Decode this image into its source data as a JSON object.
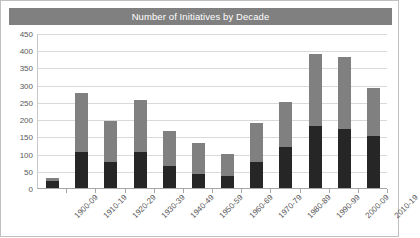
{
  "chart_data": {
    "type": "bar",
    "title": "Number of Initiatives by Decade",
    "xlabel": "",
    "ylabel": "",
    "ylim": [
      0,
      450
    ],
    "yticks": [
      0,
      50,
      100,
      150,
      200,
      250,
      300,
      350,
      400,
      450
    ],
    "ytick_labels": [
      "0",
      "50",
      "100",
      "150",
      "200",
      "250",
      "300",
      "350",
      "400",
      "450"
    ],
    "grid": true,
    "stacked": true,
    "legend": "none",
    "categories": [
      "1900-09",
      "1910-19",
      "1920-29",
      "1930-39",
      "1940-49",
      "1950-59",
      "1960-69",
      "1970-79",
      "1980-89",
      "1990-99",
      "2000-09",
      "2010-19"
    ],
    "series": [
      {
        "name": "lower-segment",
        "color": "#262626",
        "values": [
          20,
          105,
          75,
          105,
          65,
          40,
          35,
          75,
          120,
          180,
          170,
          150
        ]
      },
      {
        "name": "upper-segment",
        "color": "#808080",
        "values": [
          10,
          170,
          120,
          150,
          100,
          90,
          65,
          115,
          130,
          210,
          210,
          140
        ]
      }
    ],
    "totals": [
      30,
      275,
      195,
      255,
      165,
      130,
      100,
      190,
      250,
      390,
      380,
      290
    ]
  },
  "colors": {
    "title_band": "#808080",
    "title_text": "#ffffff",
    "bar_lower": "#262626",
    "bar_upper": "#808080",
    "gridline": "#d9d9d9",
    "axis": "#a6a6a6",
    "tick_text": "#595959",
    "frame": "#bfbfbf",
    "background": "#ffffff"
  }
}
